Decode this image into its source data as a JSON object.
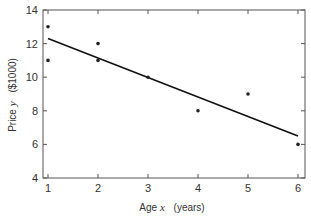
{
  "chart_data": {
    "type": "scatter",
    "title": "",
    "xlabel": "Age x   (years)",
    "xlabel_parts": {
      "name": "Age",
      "var": "x",
      "unit": "(years)"
    },
    "ylabel": "Price y   ($1000)",
    "ylabel_parts": {
      "name": "Price",
      "var": "y",
      "unit": "($1000)"
    },
    "xlim": [
      1,
      6
    ],
    "ylim": [
      4,
      14
    ],
    "x_ticks": [
      1,
      2,
      3,
      4,
      5,
      6
    ],
    "y_ticks": [
      4,
      6,
      8,
      10,
      12,
      14
    ],
    "grid": false,
    "legend": null,
    "series": [
      {
        "name": "observations",
        "kind": "scatter",
        "points": [
          {
            "x": 1,
            "y": 13
          },
          {
            "x": 1,
            "y": 11
          },
          {
            "x": 2,
            "y": 12
          },
          {
            "x": 2,
            "y": 11
          },
          {
            "x": 3,
            "y": 10
          },
          {
            "x": 4,
            "y": 8
          },
          {
            "x": 5,
            "y": 9
          },
          {
            "x": 6,
            "y": 6
          }
        ]
      },
      {
        "name": "fitted regression line",
        "kind": "line",
        "points": [
          {
            "x": 1,
            "y": 12.3
          },
          {
            "x": 6,
            "y": 6.5
          }
        ]
      }
    ],
    "colors": {
      "axis": "#555555",
      "points": "#222222",
      "line": "#111111"
    }
  }
}
